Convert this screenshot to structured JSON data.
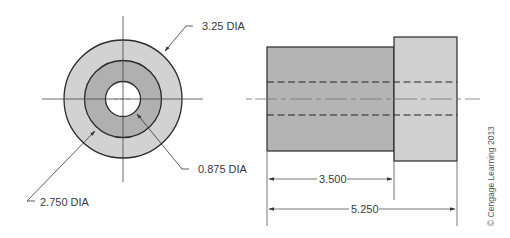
{
  "front_view": {
    "outer_label": "3.25 DIA",
    "middle_label": "2.750 DIA",
    "inner_label": "0.875 DIA",
    "outer_dia": 3.25,
    "middle_dia": 2.75,
    "inner_dia": 0.875
  },
  "side_view": {
    "dim_short_label": "3.500",
    "dim_total_label": "5.250",
    "dim_short": 3.5,
    "dim_total": 5.25
  },
  "copyright": "© Cengage Learning 2013",
  "colors": {
    "outer_fill": "#d2d2d2",
    "middle_fill": "#b0b0b0",
    "body_fill": "#b4b4b4",
    "head_fill": "#d0d0d0",
    "line": "#2a2a2a",
    "thin": "#555555"
  }
}
